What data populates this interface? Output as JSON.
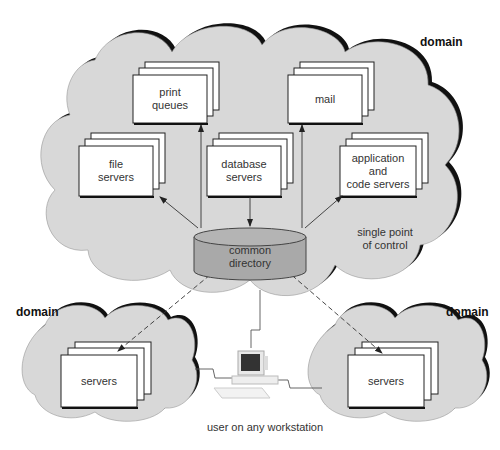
{
  "diagram": {
    "type": "network-architecture",
    "colors": {
      "cloud_fill": "#d8d8d8",
      "cloud_outline": "#111111",
      "card_fill": "#ffffff",
      "directory_fill": "#a9a9a9",
      "line": "#333333"
    },
    "main_domain": {
      "label": "domain",
      "annotation": "single point of control",
      "annotation_lines": [
        "single point",
        "of control"
      ],
      "cards": [
        {
          "id": "print-queues",
          "lines": [
            "print",
            "queues"
          ]
        },
        {
          "id": "mail",
          "lines": [
            "mail"
          ]
        },
        {
          "id": "file-servers",
          "lines": [
            "file",
            "servers"
          ]
        },
        {
          "id": "database-servers",
          "lines": [
            "database",
            "servers"
          ]
        },
        {
          "id": "app-servers",
          "lines": [
            "application",
            "and",
            "code servers"
          ]
        }
      ],
      "directory": {
        "lines": [
          "common",
          "directory"
        ]
      }
    },
    "left_domain": {
      "label": "domain",
      "card": {
        "lines": [
          "servers"
        ]
      }
    },
    "right_domain": {
      "label": "domain",
      "card": {
        "lines": [
          "servers"
        ]
      }
    },
    "workstation": {
      "label": "user on any workstation"
    },
    "connections": [
      {
        "from": "common directory",
        "to": "file servers",
        "style": "solid-arrow"
      },
      {
        "from": "common directory",
        "to": "print queues",
        "style": "solid-arrow"
      },
      {
        "from": "database servers",
        "to": "common directory",
        "style": "solid-arrow"
      },
      {
        "from": "common directory",
        "to": "mail",
        "style": "solid-arrow"
      },
      {
        "from": "common directory",
        "to": "application and code servers",
        "style": "solid-arrow"
      },
      {
        "from": "common directory",
        "to": "left domain servers",
        "style": "dashed-arrow"
      },
      {
        "from": "common directory",
        "to": "right domain servers",
        "style": "dashed-arrow"
      },
      {
        "from": "workstation",
        "to": "main domain",
        "style": "network-line"
      },
      {
        "from": "workstation",
        "to": "left domain",
        "style": "network-line"
      },
      {
        "from": "workstation",
        "to": "right domain",
        "style": "network-line"
      }
    ]
  }
}
